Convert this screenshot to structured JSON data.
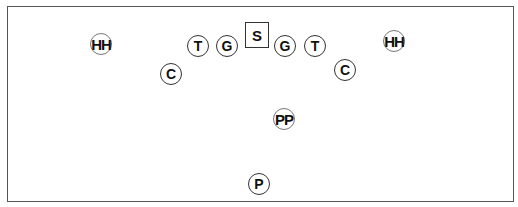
{
  "diagram": {
    "type": "punt formation",
    "border_color": "#555555",
    "players": [
      {
        "id": "hh-left",
        "label": "HH",
        "x": 101,
        "y": 44,
        "shape": "circle"
      },
      {
        "id": "c-left",
        "label": "C",
        "x": 171,
        "y": 74,
        "shape": "circle"
      },
      {
        "id": "t-left",
        "label": "T",
        "x": 198,
        "y": 46,
        "shape": "circle"
      },
      {
        "id": "g-left",
        "label": "G",
        "x": 227,
        "y": 46,
        "shape": "circle"
      },
      {
        "id": "s",
        "label": "S",
        "x": 257,
        "y": 35,
        "shape": "square"
      },
      {
        "id": "g-right",
        "label": "G",
        "x": 285,
        "y": 46,
        "shape": "circle"
      },
      {
        "id": "t-right",
        "label": "T",
        "x": 315,
        "y": 46,
        "shape": "circle"
      },
      {
        "id": "c-right",
        "label": "C",
        "x": 345,
        "y": 70,
        "shape": "circle"
      },
      {
        "id": "hh-right",
        "label": "HH",
        "x": 394,
        "y": 41,
        "shape": "circle"
      },
      {
        "id": "pp",
        "label": "PP",
        "x": 284,
        "y": 119,
        "shape": "circle"
      },
      {
        "id": "p",
        "label": "P",
        "x": 259,
        "y": 184,
        "shape": "circle"
      }
    ]
  }
}
